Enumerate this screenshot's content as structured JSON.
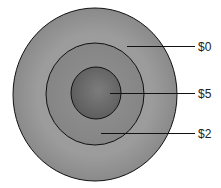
{
  "diagram": {
    "rings": [
      {
        "name": "outer",
        "label": "$0",
        "color": "#a2a2a2"
      },
      {
        "name": "middle",
        "label": "$2",
        "color": "#8e8e8e"
      },
      {
        "name": "inner",
        "label": "$5",
        "color": "#747474"
      }
    ],
    "labels": {
      "outer": "$0",
      "inner": "$5",
      "middle": "$2"
    }
  }
}
